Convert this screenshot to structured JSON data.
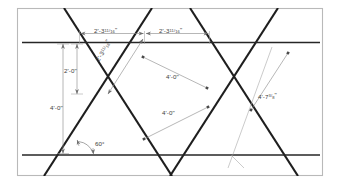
{
  "drawing": {
    "title": "Triangular lattice layout with 60 degree diagonals",
    "background_color": "#ffffff",
    "frame_color": "#b9b9b9",
    "line_color": "#1e1e1e",
    "dimension_color": "#8a8a8a",
    "text_color": "#3c3c3c"
  },
  "dimensions": {
    "top_span_1": {
      "label_whole": "2'-3",
      "label_num": "11",
      "label_den": "16",
      "label_unit": "\"",
      "full": "2'-3 11/16\""
    },
    "top_span_2": {
      "label_whole": "2'-3",
      "label_num": "11",
      "label_den": "16",
      "label_unit": "\"",
      "full": "2'-3 11/16\""
    },
    "diagonal_upper_left": {
      "label_whole": "2'-3",
      "label_num": "11",
      "label_den": "16",
      "label_unit": "\"",
      "full": "2'-3 11/16\""
    },
    "vertical_half": {
      "full": "2'-0\""
    },
    "vertical_full": {
      "full": "4'-0\""
    },
    "diagonal_center_upper": {
      "full": "4'-0\""
    },
    "diagonal_center_lower": {
      "full": "4'-0\""
    },
    "diagonal_right": {
      "label_whole": "4'-7",
      "label_num": "3",
      "label_den": "8",
      "label_unit": "\"",
      "full": "4'-7 3/8\""
    },
    "angle": {
      "full": "60°"
    }
  }
}
